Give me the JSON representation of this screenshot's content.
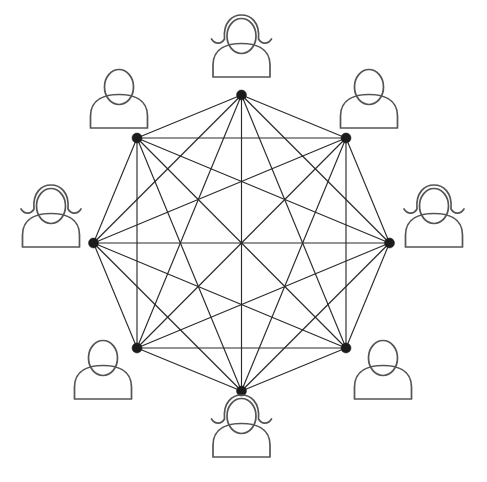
{
  "diagram": {
    "type": "complete-graph",
    "node_count": 8,
    "edge_count": 28,
    "background_color": "#ffffff",
    "edge_color": "#2b2b2b",
    "node_color": "#1c1c1c",
    "icon_stroke_color": "#545454",
    "node_radius_px": 5,
    "graph_center": {
      "x": 241.5,
      "y": 243
    },
    "graph_circumradius_px": 148,
    "icon_ring_radius_px": 215,
    "nodes": [
      {
        "id": "node-1",
        "label": "",
        "angle_deg": 270,
        "x": 241.5,
        "y": 95,
        "icon": "person-female-icon",
        "gender": "female",
        "position": "top"
      },
      {
        "id": "node-2",
        "label": "",
        "angle_deg": 315,
        "x": 346,
        "y": 138,
        "icon": "person-male-icon",
        "gender": "male",
        "position": "top-right"
      },
      {
        "id": "node-3",
        "label": "",
        "angle_deg": 0,
        "x": 389.5,
        "y": 243,
        "icon": "person-female-icon",
        "gender": "female",
        "position": "right"
      },
      {
        "id": "node-4",
        "label": "",
        "angle_deg": 45,
        "x": 346,
        "y": 348,
        "icon": "person-male-icon",
        "gender": "male",
        "position": "bottom-right"
      },
      {
        "id": "node-5",
        "label": "",
        "angle_deg": 90,
        "x": 241.5,
        "y": 391,
        "icon": "person-female-icon",
        "gender": "female",
        "position": "bottom"
      },
      {
        "id": "node-6",
        "label": "",
        "angle_deg": 135,
        "x": 137,
        "y": 348,
        "icon": "person-male-icon",
        "gender": "male",
        "position": "bottom-left"
      },
      {
        "id": "node-7",
        "label": "",
        "angle_deg": 180,
        "x": 93.5,
        "y": 243,
        "icon": "person-female-icon",
        "gender": "female",
        "position": "left"
      },
      {
        "id": "node-8",
        "label": "",
        "angle_deg": 225,
        "x": 137,
        "y": 138,
        "icon": "person-male-icon",
        "gender": "male",
        "position": "top-left"
      }
    ],
    "icons": [
      {
        "id": "icon-1",
        "name": "person-female-icon",
        "gender": "female",
        "x": 241.5,
        "y": 52,
        "position": "top"
      },
      {
        "id": "icon-2",
        "name": "person-male-icon",
        "gender": "male",
        "x": 369,
        "y": 103,
        "position": "top-right"
      },
      {
        "id": "icon-3",
        "name": "person-female-icon",
        "gender": "female",
        "x": 434,
        "y": 222,
        "position": "right"
      },
      {
        "id": "icon-4",
        "name": "person-male-icon",
        "gender": "male",
        "x": 383,
        "y": 374,
        "position": "bottom-right"
      },
      {
        "id": "icon-5",
        "name": "person-female-icon",
        "gender": "female",
        "x": 241.5,
        "y": 432,
        "position": "bottom"
      },
      {
        "id": "icon-6",
        "name": "person-male-icon",
        "gender": "male",
        "x": 103,
        "y": 374,
        "position": "bottom-left"
      },
      {
        "id": "icon-7",
        "name": "person-female-icon",
        "gender": "female",
        "x": 51,
        "y": 222,
        "position": "left"
      },
      {
        "id": "icon-8",
        "name": "person-male-icon",
        "gender": "male",
        "x": 119,
        "y": 103,
        "position": "top-left"
      }
    ]
  }
}
